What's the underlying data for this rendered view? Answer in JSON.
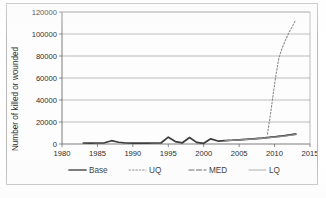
{
  "chart_data": {
    "type": "line",
    "title": "",
    "xlabel": "",
    "ylabel": "Number of killed or wounded",
    "xlim": [
      1980,
      2015
    ],
    "ylim": [
      0,
      120000
    ],
    "x_ticks": [
      "1980",
      "1985",
      "1990",
      "1995",
      "2000",
      "2005",
      "2010",
      "2015"
    ],
    "x_tick_values": [
      1980,
      1985,
      1990,
      1995,
      2000,
      2005,
      2010,
      2015
    ],
    "y_ticks": [
      "0",
      "20000",
      "40000",
      "60000",
      "80000",
      "100000",
      "120000"
    ],
    "y_tick_values": [
      0,
      20000,
      40000,
      60000,
      80000,
      100000,
      120000
    ],
    "grid": "horizontal",
    "legend_position": "bottom",
    "series": [
      {
        "name": "Base",
        "style": "solid-thick",
        "color": "#3d3d3d",
        "x": [
          1983,
          1984,
          1985,
          1986,
          1987,
          1988,
          1989,
          1990,
          1991,
          1992,
          1993,
          1994,
          1995,
          1996,
          1997,
          1998,
          1999,
          2000,
          2001,
          2002,
          2003,
          2004,
          2005,
          2006,
          2007,
          2008,
          2009,
          2010,
          2011,
          2012,
          2013
        ],
        "values": [
          900,
          800,
          900,
          1100,
          3000,
          1600,
          900,
          800,
          900,
          800,
          900,
          1100,
          6200,
          2200,
          1100,
          5900,
          1500,
          600,
          4700,
          2700,
          3000,
          3400,
          3800,
          4200,
          4700,
          5200,
          5800,
          6400,
          7100,
          8000,
          9000
        ]
      },
      {
        "name": "UQ",
        "style": "dotted",
        "color": "#8a8a8a",
        "x": [
          2009,
          2009.4,
          2009.8,
          2010.2,
          2010.6,
          2011,
          2011.5,
          2012,
          2012.5,
          2013
        ],
        "values": [
          9000,
          26000,
          45000,
          63000,
          78000,
          86000,
          94000,
          101000,
          107000,
          113000
        ]
      },
      {
        "name": "MED",
        "style": "dashed",
        "color": "#5a5a5a",
        "x": [
          2003,
          2005,
          2007,
          2009,
          2011,
          2013
        ],
        "values": [
          3000,
          3900,
          4800,
          6000,
          7300,
          9200
        ]
      },
      {
        "name": "LQ",
        "style": "solid-thin",
        "color": "#9a9a9a",
        "x": [
          2003,
          2005,
          2007,
          2009,
          2011,
          2013
        ],
        "values": [
          2900,
          3700,
          4500,
          5600,
          6800,
          8500
        ]
      }
    ],
    "legend": [
      {
        "label": "Base",
        "style": "solid-thick",
        "color": "#3d3d3d"
      },
      {
        "label": "UQ",
        "style": "dotted",
        "color": "#8a8a8a"
      },
      {
        "label": "MED",
        "style": "dashed",
        "color": "#5a5a5a"
      },
      {
        "label": "LQ",
        "style": "solid-thin",
        "color": "#9a9a9a"
      }
    ]
  }
}
